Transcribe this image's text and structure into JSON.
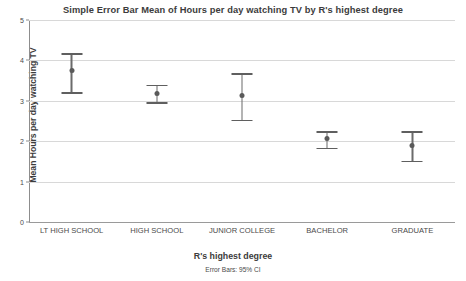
{
  "chart_data": {
    "type": "scatter",
    "title": "Simple Error Bar Mean of Hours per day watching TV by R's highest degree",
    "xlabel": "R's highest degree",
    "ylabel": "Mean Hours per day watching TV",
    "footnote": "Error Bars: 95% CI",
    "grid": true,
    "legend": "none",
    "ylim": [
      0,
      5
    ],
    "yticks": [
      0,
      1,
      2,
      3,
      4,
      5
    ],
    "ytick_labels": [
      "0",
      "1",
      "2",
      "3",
      "4",
      "5"
    ],
    "categories": [
      "LT HIGH SCHOOL",
      "HIGH SCHOOL",
      "JUNIOR COLLEGE",
      "BACHELOR",
      "GRADUATE"
    ],
    "values": [
      3.76,
      3.19,
      3.12,
      2.06,
      1.9
    ],
    "ci_lower": [
      3.21,
      2.97,
      2.53,
      1.84,
      1.51
    ],
    "ci_upper": [
      4.18,
      3.4,
      3.68,
      2.25,
      2.25
    ],
    "points": [
      {
        "category": "LT HIGH SCHOOL",
        "mean": 3.76,
        "ci_lower": 3.21,
        "ci_upper": 4.18
      },
      {
        "category": "HIGH SCHOOL",
        "mean": 3.19,
        "ci_lower": 2.97,
        "ci_upper": 3.4
      },
      {
        "category": "JUNIOR COLLEGE",
        "mean": 3.12,
        "ci_lower": 2.53,
        "ci_upper": 3.68
      },
      {
        "category": "BACHELOR",
        "mean": 2.06,
        "ci_lower": 1.84,
        "ci_upper": 2.25
      },
      {
        "category": "GRADUATE",
        "mean": 1.9,
        "ci_lower": 1.51,
        "ci_upper": 2.25
      }
    ],
    "colors": {
      "marker": "#5a5a5a",
      "whisker": "#6b6b6b",
      "gridline": "#d8d8d8",
      "axis": "#8d8d8d",
      "text": "#3c3c3c"
    }
  }
}
